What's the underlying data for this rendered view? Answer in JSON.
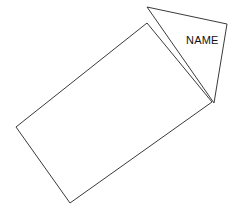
{
  "canvas": {
    "width": 235,
    "height": 213,
    "background_color": "#ffffff",
    "stroke_color": "#3a3a3a",
    "stroke_width": 1,
    "text_color": "#111111"
  },
  "diagram": {
    "shapes": [
      {
        "id": "rectangle",
        "kind": "rectangle",
        "label": "",
        "points": "147,23 212,102 70,203 16,127",
        "vertices": [
          {
            "name": "top",
            "x": 147,
            "y": 23
          },
          {
            "name": "right",
            "x": 212,
            "y": 102
          },
          {
            "name": "bottom",
            "x": 70,
            "y": 203
          },
          {
            "name": "left",
            "x": 16,
            "y": 127
          }
        ]
      },
      {
        "id": "triangle",
        "kind": "triangle",
        "label": "NAME",
        "points": "147,7 227,24 214,103",
        "vertices": [
          {
            "name": "apex",
            "x": 147,
            "y": 7
          },
          {
            "name": "right",
            "x": 227,
            "y": 24
          },
          {
            "name": "bottom",
            "x": 214,
            "y": 103
          }
        ]
      }
    ],
    "labels": [
      {
        "id": "triangle-name-label",
        "text": "NAME",
        "x": 186,
        "y": 44,
        "font_size": 11
      }
    ]
  }
}
